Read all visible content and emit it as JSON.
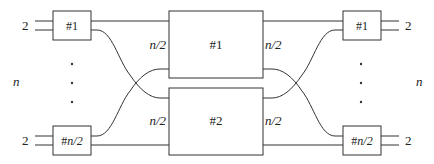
{
  "diagram": {
    "type": "network-block-diagram",
    "left_label": "n",
    "right_label": "n",
    "left_switches": {
      "top": {
        "label_prefix": "#",
        "label_index": "1",
        "port_count": "2"
      },
      "bottom": {
        "label_prefix": "#",
        "label_index": "n/2",
        "port_count": "2"
      }
    },
    "right_switches": {
      "top": {
        "label_prefix": "#",
        "label_index": "1",
        "port_count": "2"
      },
      "bottom": {
        "label_prefix": "#",
        "label_index": "n/2",
        "port_count": "2"
      }
    },
    "middle_blocks": [
      {
        "label": "#1",
        "left_port_label": "n/2",
        "right_port_label": "n/2"
      },
      {
        "label": "#2",
        "left_port_label": "n/2",
        "right_port_label": "n/2"
      }
    ],
    "ellipsis": "· · ·",
    "colors": {
      "stroke": "#333333",
      "background": "#ffffff",
      "text": "#222222"
    }
  }
}
